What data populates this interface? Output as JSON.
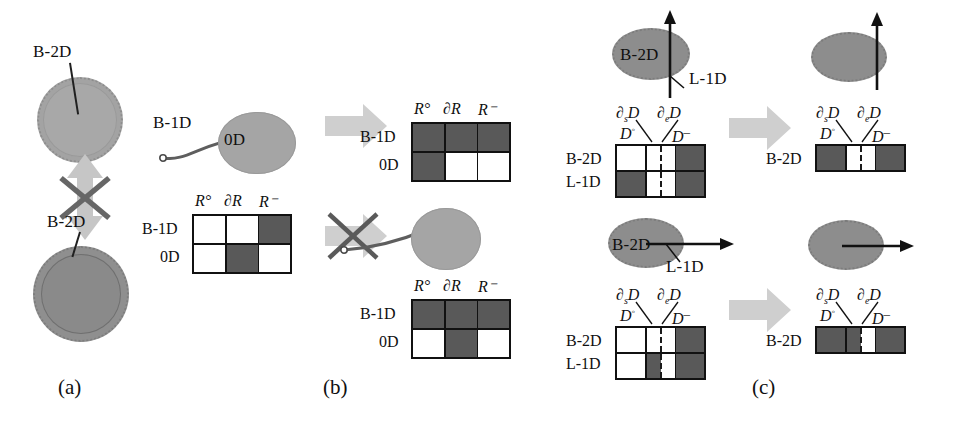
{
  "figure": {
    "panels": [
      {
        "id": "a",
        "label": "(a)"
      },
      {
        "id": "b",
        "label": "(b)"
      },
      {
        "id": "c",
        "label": "(c)"
      }
    ]
  },
  "panel_a": {
    "top_shape_label": "B-2D",
    "bottom_shape_label": "B-2D",
    "relation_icon": "crossed-double-arrow",
    "icon_colors": {
      "arrow": "#c8c8c8",
      "cross": "#6a6a6a"
    }
  },
  "panel_b": {
    "source": {
      "filament_label": "B-1D",
      "blob_label": "0D",
      "matrix": {
        "col_headers": [
          "R°",
          "∂R",
          "R⁻"
        ],
        "row_headers": [
          "B-1D",
          "0D"
        ],
        "cells": [
          [
            "light",
            "light",
            "dark"
          ],
          [
            "light",
            "dark",
            "light"
          ]
        ]
      }
    },
    "result_top": {
      "matrix": {
        "col_headers": [
          "R°",
          "∂R",
          "R⁻"
        ],
        "row_headers": [
          "B-1D",
          "0D"
        ],
        "cells": [
          [
            "dark",
            "dark",
            "dark"
          ],
          [
            "dark",
            "light",
            "light"
          ]
        ]
      }
    },
    "result_bottom": {
      "matrix": {
        "col_headers": [
          "R°",
          "∂R",
          "R⁻"
        ],
        "row_headers": [
          "B-1D",
          "0D"
        ],
        "cells": [
          [
            "dark",
            "dark",
            "dark"
          ],
          [
            "light",
            "dark",
            "light"
          ]
        ]
      }
    },
    "arrow_top_state": "allowed",
    "arrow_bottom_state": "crossed-out"
  },
  "panel_c": {
    "top": {
      "blob_label": "B-2D",
      "line_label": "L-1D",
      "line_orientation": "vertical-through",
      "matrix": {
        "col_headers_upper": [
          "∂ₛD",
          "∂ₑD"
        ],
        "col_headers_lower": [
          "D°",
          "D⁻"
        ],
        "row_headers": [
          "B-2D",
          "L-1D"
        ],
        "cells": [
          [
            "light",
            {
              "left": "light",
              "right": "light"
            },
            "dark"
          ],
          [
            "dark",
            {
              "left": "light",
              "right": "light"
            },
            "dark"
          ]
        ]
      },
      "result": {
        "row_header": "B-2D",
        "col_headers_upper": [
          "∂ₛD",
          "∂ₑD"
        ],
        "col_headers_lower": [
          "D°",
          "D⁻"
        ],
        "cells": [
          "dark",
          {
            "left": "light",
            "right": "light"
          },
          "dark"
        ]
      }
    },
    "bottom": {
      "blob_label": "B-2D",
      "line_label": "L-1D",
      "line_orientation": "horizontal-tangent",
      "matrix": {
        "col_headers_upper": [
          "∂ₛD",
          "∂ₑD"
        ],
        "col_headers_lower": [
          "D°",
          "D⁻"
        ],
        "row_headers": [
          "B-2D",
          "L-1D"
        ],
        "cells": [
          [
            "light",
            {
              "left": "light",
              "right": "light"
            },
            "dark"
          ],
          [
            "light",
            {
              "left": "dark",
              "right": "light"
            },
            "dark"
          ]
        ]
      },
      "result": {
        "row_header": "B-2D",
        "col_headers_upper": [
          "∂ₛD",
          "∂ₑD"
        ],
        "col_headers_lower": [
          "D°",
          "D⁻"
        ],
        "cells": [
          "dark",
          {
            "left": "dark",
            "right": "light"
          },
          "dark"
        ]
      }
    }
  },
  "colors": {
    "dark_cell": "#595959",
    "light_cell": "#ffffff",
    "grid_line": "#111111",
    "blob_light": "#a5a5a5",
    "blob_dark": "#8d8d8d",
    "fat_arrow": "#cccccc"
  }
}
